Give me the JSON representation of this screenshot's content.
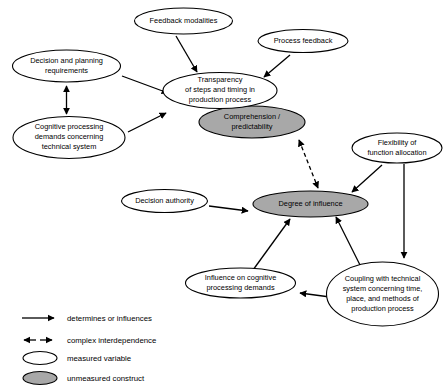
{
  "diagram": {
    "colors": {
      "measured_fill": "#ffffff",
      "unmeasured_fill": "#a8a8a8",
      "stroke": "#000000",
      "background": "#ffffff"
    },
    "nodes": [
      {
        "id": "feedback-modalities",
        "label": "Feedback modalities",
        "lines": [
          "Feedback modalities"
        ],
        "type": "measured",
        "cx": 183.5,
        "cy": 21,
        "rx": 49,
        "ry": 13
      },
      {
        "id": "process-feedback",
        "label": "Process feedback",
        "lines": [
          "Process feedback"
        ],
        "type": "measured",
        "cx": 303,
        "cy": 41,
        "rx": 45,
        "ry": 11.5
      },
      {
        "id": "decision-and-planning-requirements",
        "label": "Decision and planning requirements",
        "lines": [
          "Decision and planning",
          "requirements"
        ],
        "type": "measured",
        "cx": 66.5,
        "cy": 66,
        "rx": 54,
        "ry": 16
      },
      {
        "id": "cognitive-processing-demands",
        "label": "Cognitive processing demands concerning technical system",
        "lines": [
          "Cognitive processing",
          "demands concerning",
          "technical system"
        ],
        "type": "measured",
        "cx": 69,
        "cy": 137.5,
        "rx": 56,
        "ry": 21
      },
      {
        "id": "transparency",
        "label": "Transparency of steps and timing in production process",
        "lines": [
          "Transparency",
          "of steps and timing in",
          "production process"
        ],
        "type": "measured",
        "cx": 220,
        "cy": 90.5,
        "rx": 57,
        "ry": 18
      },
      {
        "id": "comprehension-predictability",
        "label": "Comprehension / predictability",
        "lines": [
          "Comprehension /",
          "predictability"
        ],
        "type": "unmeasured",
        "cx": 252,
        "cy": 122,
        "rx": 53,
        "ry": 16
      },
      {
        "id": "flexibility-of-function-allocation",
        "label": "Flexibility of function allocation",
        "lines": [
          "Flexibility of",
          "function allocation"
        ],
        "type": "measured",
        "cx": 397,
        "cy": 148,
        "rx": 45,
        "ry": 15
      },
      {
        "id": "decision-authority",
        "label": "Decision authority",
        "lines": [
          "Decision authority"
        ],
        "type": "measured",
        "cx": 164.5,
        "cy": 201,
        "rx": 43,
        "ry": 11.5
      },
      {
        "id": "degree-of-influence",
        "label": "Degree of influence",
        "lines": [
          "Degree of influence"
        ],
        "type": "unmeasured",
        "cx": 310.5,
        "cy": 204,
        "rx": 57.5,
        "ry": 13
      },
      {
        "id": "influence-on-cognitive-processing-demands",
        "label": "Influence on cognitive processing demands",
        "lines": [
          "Influence on cognitive",
          "processing demands"
        ],
        "type": "measured",
        "cx": 240.5,
        "cy": 283,
        "rx": 55,
        "ry": 15
      },
      {
        "id": "coupling-with-technical-system",
        "label": "Coupling with technical system concerning time, place, and methods of production process",
        "lines": [
          "Coupling with technical",
          "system concerning time,",
          "place, and methods of",
          "production process"
        ],
        "type": "measured",
        "cx": 382.5,
        "cy": 294,
        "rx": 56,
        "ry": 32
      }
    ],
    "edges": [
      {
        "id": "e-feedback-to-transparency",
        "from": "feedback-modalities",
        "to": "transparency",
        "style": "solid",
        "arrows": "end"
      },
      {
        "id": "e-process-to-transparency",
        "from": "process-feedback",
        "to": "transparency",
        "style": "solid",
        "arrows": "end"
      },
      {
        "id": "e-decision-to-transparency",
        "from": "decision-and-planning-requirements",
        "to": "transparency",
        "style": "solid",
        "arrows": "end"
      },
      {
        "id": "e-cognitive-to-transparency",
        "from": "cognitive-processing-demands",
        "to": "transparency",
        "style": "solid",
        "arrows": "end"
      },
      {
        "id": "e-decision-cognitive-interdependence",
        "from": "decision-and-planning-requirements",
        "to": "cognitive-processing-demands",
        "style": "solid",
        "arrows": "both"
      },
      {
        "id": "e-comprehension-degree-interdependence",
        "from": "comprehension-predictability",
        "to": "degree-of-influence",
        "style": "dashed",
        "arrows": "both"
      },
      {
        "id": "e-flexibility-to-degree",
        "from": "flexibility-of-function-allocation",
        "to": "degree-of-influence",
        "style": "solid",
        "arrows": "end"
      },
      {
        "id": "e-flexibility-to-coupling",
        "from": "flexibility-of-function-allocation",
        "to": "coupling-with-technical-system",
        "style": "solid",
        "arrows": "end"
      },
      {
        "id": "e-decision-authority-to-degree",
        "from": "decision-authority",
        "to": "degree-of-influence",
        "style": "solid",
        "arrows": "end"
      },
      {
        "id": "e-influence-to-degree",
        "from": "influence-on-cognitive-processing-demands",
        "to": "degree-of-influence",
        "style": "solid",
        "arrows": "end"
      },
      {
        "id": "e-coupling-to-degree",
        "from": "coupling-with-technical-system",
        "to": "degree-of-influence",
        "style": "solid",
        "arrows": "end"
      },
      {
        "id": "e-coupling-to-influence",
        "from": "coupling-with-technical-system",
        "to": "influence-on-cognitive-processing-demands",
        "style": "solid",
        "arrows": "end"
      }
    ]
  },
  "legend": {
    "items": [
      {
        "id": "legend-determines",
        "symbol": "single-arrow",
        "label": "determines or influences"
      },
      {
        "id": "legend-interdependence",
        "symbol": "double-arrow",
        "label": "complex interdependence"
      },
      {
        "id": "legend-measured",
        "symbol": "white-ellipse",
        "label": "measured variable"
      },
      {
        "id": "legend-unmeasured",
        "symbol": "grey-ellipse",
        "label": "unmeasured construct"
      }
    ]
  }
}
